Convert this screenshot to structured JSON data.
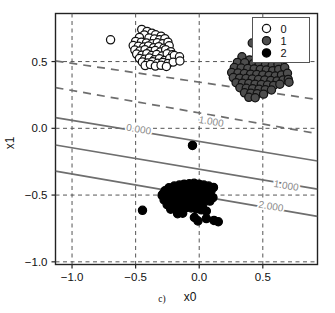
{
  "figure": {
    "panel_label": "c)",
    "background_color": "#ffffff"
  },
  "chart_data": {
    "type": "scatter",
    "title": "",
    "xlabel": "x0",
    "ylabel": "x1",
    "xlim": [
      -1.13,
      0.93
    ],
    "ylim": [
      -1.02,
      0.86
    ],
    "xticks": [
      -1.0,
      -0.5,
      0.0,
      0.5
    ],
    "yticks": [
      -1.0,
      -0.5,
      0.0,
      0.5
    ],
    "xticklabels": [
      "-1.0",
      "-0.5",
      "0.0",
      "0.5"
    ],
    "yticklabels": [
      "-1.0",
      "-0.5",
      "0.0",
      "0.5"
    ],
    "grid": true,
    "grid_style": "dashed",
    "grid_color": "#555555",
    "legend_position": "upper right",
    "series": [
      {
        "name": "0",
        "label": "0",
        "marker": "circle",
        "marker_fill": "#ffffff",
        "marker_edge": "#111111",
        "points": [
          [
            -0.697,
            0.663
          ],
          [
            -0.452,
            0.741
          ],
          [
            -0.41,
            0.726
          ],
          [
            -0.372,
            0.713
          ],
          [
            -0.432,
            0.7
          ],
          [
            -0.343,
            0.701
          ],
          [
            -0.3,
            0.69
          ],
          [
            -0.47,
            0.681
          ],
          [
            -0.395,
            0.676
          ],
          [
            -0.352,
            0.669
          ],
          [
            -0.312,
            0.663
          ],
          [
            -0.27,
            0.672
          ],
          [
            -0.5,
            0.651
          ],
          [
            -0.455,
            0.645
          ],
          [
            -0.415,
            0.64
          ],
          [
            -0.37,
            0.634
          ],
          [
            -0.33,
            0.641
          ],
          [
            -0.288,
            0.633
          ],
          [
            -0.246,
            0.645
          ],
          [
            -0.519,
            0.62
          ],
          [
            -0.478,
            0.614
          ],
          [
            -0.437,
            0.609
          ],
          [
            -0.399,
            0.617
          ],
          [
            -0.358,
            0.604
          ],
          [
            -0.318,
            0.612
          ],
          [
            -0.277,
            0.6
          ],
          [
            -0.236,
            0.618
          ],
          [
            -0.506,
            0.586
          ],
          [
            -0.466,
            0.58
          ],
          [
            -0.426,
            0.589
          ],
          [
            -0.387,
            0.576
          ],
          [
            -0.346,
            0.583
          ],
          [
            -0.305,
            0.572
          ],
          [
            -0.264,
            0.589
          ],
          [
            -0.224,
            0.574
          ],
          [
            -0.492,
            0.556
          ],
          [
            -0.451,
            0.548
          ],
          [
            -0.412,
            0.559
          ],
          [
            -0.374,
            0.545
          ],
          [
            -0.334,
            0.553
          ],
          [
            -0.292,
            0.541
          ],
          [
            -0.252,
            0.558
          ],
          [
            -0.21,
            0.551
          ],
          [
            -0.47,
            0.524
          ],
          [
            -0.43,
            0.517
          ],
          [
            -0.392,
            0.527
          ],
          [
            -0.353,
            0.513
          ],
          [
            -0.313,
            0.521
          ],
          [
            -0.272,
            0.509
          ],
          [
            -0.232,
            0.523
          ],
          [
            -0.196,
            0.545
          ],
          [
            -0.447,
            0.497
          ],
          [
            -0.406,
            0.489
          ],
          [
            -0.367,
            0.498
          ],
          [
            -0.328,
            0.487
          ],
          [
            -0.287,
            0.494
          ],
          [
            -0.245,
            0.486
          ],
          [
            -0.205,
            0.496
          ],
          [
            -0.425,
            0.47
          ],
          [
            -0.384,
            0.478
          ],
          [
            -0.345,
            0.466
          ],
          [
            -0.3,
            0.472
          ],
          [
            -0.258,
            0.463
          ],
          [
            -0.155,
            0.536
          ],
          [
            -0.152,
            0.504
          ]
        ]
      },
      {
        "name": "1",
        "label": "1",
        "marker": "circle",
        "marker_fill": "#4d4d4d",
        "marker_edge": "#111111",
        "points": [
          [
            0.417,
            0.639
          ],
          [
            0.478,
            0.625
          ],
          [
            0.531,
            0.598
          ],
          [
            0.566,
            0.57
          ],
          [
            0.515,
            0.554
          ],
          [
            0.336,
            0.536
          ],
          [
            0.452,
            0.536
          ],
          [
            0.56,
            0.52
          ],
          [
            0.396,
            0.512
          ],
          [
            0.489,
            0.505
          ],
          [
            0.3,
            0.494
          ],
          [
            0.358,
            0.491
          ],
          [
            0.425,
            0.484
          ],
          [
            0.471,
            0.48
          ],
          [
            0.521,
            0.474
          ],
          [
            0.573,
            0.468
          ],
          [
            0.619,
            0.48
          ],
          [
            0.276,
            0.455
          ],
          [
            0.33,
            0.452
          ],
          [
            0.382,
            0.448
          ],
          [
            0.432,
            0.444
          ],
          [
            0.48,
            0.44
          ],
          [
            0.528,
            0.437
          ],
          [
            0.578,
            0.432
          ],
          [
            0.625,
            0.441
          ],
          [
            0.672,
            0.455
          ],
          [
            0.255,
            0.418
          ],
          [
            0.305,
            0.414
          ],
          [
            0.355,
            0.41
          ],
          [
            0.404,
            0.406
          ],
          [
            0.452,
            0.403
          ],
          [
            0.5,
            0.399
          ],
          [
            0.549,
            0.396
          ],
          [
            0.598,
            0.392
          ],
          [
            0.647,
            0.4
          ],
          [
            0.694,
            0.412
          ],
          [
            0.268,
            0.38
          ],
          [
            0.318,
            0.376
          ],
          [
            0.368,
            0.373
          ],
          [
            0.417,
            0.369
          ],
          [
            0.466,
            0.365
          ],
          [
            0.515,
            0.362
          ],
          [
            0.563,
            0.358
          ],
          [
            0.612,
            0.355
          ],
          [
            0.66,
            0.363
          ],
          [
            0.29,
            0.342
          ],
          [
            0.34,
            0.338
          ],
          [
            0.39,
            0.335
          ],
          [
            0.439,
            0.331
          ],
          [
            0.488,
            0.328
          ],
          [
            0.537,
            0.324
          ],
          [
            0.585,
            0.321
          ],
          [
            0.634,
            0.33
          ],
          [
            0.32,
            0.304
          ],
          [
            0.37,
            0.3
          ],
          [
            0.42,
            0.297
          ],
          [
            0.47,
            0.293
          ],
          [
            0.519,
            0.29
          ],
          [
            0.568,
            0.287
          ],
          [
            0.356,
            0.266
          ],
          [
            0.406,
            0.263
          ],
          [
            0.456,
            0.259
          ],
          [
            0.506,
            0.256
          ],
          [
            0.39,
            0.232
          ],
          [
            0.44,
            0.229
          ],
          [
            0.7,
            0.366
          ],
          [
            0.706,
            0.345
          ]
        ]
      },
      {
        "name": "2",
        "label": "2",
        "marker": "circle",
        "marker_fill": "#000000",
        "marker_edge": "#000000",
        "points": [
          [
            -0.053,
            -0.128
          ],
          [
            -0.446,
            -0.614
          ],
          [
            -0.286,
            -0.492
          ],
          [
            -0.238,
            -0.445
          ],
          [
            -0.196,
            -0.432
          ],
          [
            -0.156,
            -0.425
          ],
          [
            -0.118,
            -0.418
          ],
          [
            -0.078,
            -0.415
          ],
          [
            -0.04,
            -0.412
          ],
          [
            -0.002,
            -0.418
          ],
          [
            0.036,
            -0.425
          ],
          [
            0.074,
            -0.432
          ],
          [
            0.112,
            -0.443
          ],
          [
            -0.268,
            -0.467
          ],
          [
            -0.228,
            -0.461
          ],
          [
            -0.188,
            -0.456
          ],
          [
            -0.148,
            -0.452
          ],
          [
            -0.108,
            -0.448
          ],
          [
            -0.068,
            -0.446
          ],
          [
            -0.028,
            -0.449
          ],
          [
            0.012,
            -0.455
          ],
          [
            0.052,
            -0.463
          ],
          [
            0.092,
            -0.472
          ],
          [
            -0.292,
            -0.502
          ],
          [
            -0.252,
            -0.496
          ],
          [
            -0.212,
            -0.491
          ],
          [
            -0.172,
            -0.487
          ],
          [
            -0.132,
            -0.484
          ],
          [
            -0.092,
            -0.482
          ],
          [
            -0.052,
            -0.485
          ],
          [
            -0.012,
            -0.491
          ],
          [
            0.028,
            -0.499
          ],
          [
            0.068,
            -0.508
          ],
          [
            0.108,
            -0.519
          ],
          [
            -0.276,
            -0.537
          ],
          [
            -0.236,
            -0.532
          ],
          [
            -0.196,
            -0.527
          ],
          [
            -0.156,
            -0.523
          ],
          [
            -0.116,
            -0.52
          ],
          [
            -0.076,
            -0.518
          ],
          [
            -0.036,
            -0.521
          ],
          [
            0.004,
            -0.527
          ],
          [
            0.044,
            -0.535
          ],
          [
            0.084,
            -0.545
          ],
          [
            -0.252,
            -0.572
          ],
          [
            -0.212,
            -0.567
          ],
          [
            -0.172,
            -0.563
          ],
          [
            -0.132,
            -0.559
          ],
          [
            -0.092,
            -0.556
          ],
          [
            -0.052,
            -0.559
          ],
          [
            -0.012,
            -0.565
          ],
          [
            0.028,
            -0.573
          ],
          [
            -0.224,
            -0.606
          ],
          [
            -0.184,
            -0.601
          ],
          [
            -0.144,
            -0.597
          ],
          [
            -0.104,
            -0.594
          ],
          [
            -0.064,
            -0.597
          ],
          [
            -0.024,
            -0.603
          ],
          [
            0.016,
            -0.611
          ],
          [
            0.056,
            -0.62
          ],
          [
            -0.17,
            -0.64
          ],
          [
            -0.13,
            -0.636
          ],
          [
            -0.038,
            -0.668
          ],
          [
            0.056,
            -0.676
          ],
          [
            0.116,
            -0.69
          ],
          [
            0.15,
            -0.7
          ],
          [
            -0.01,
            -0.694
          ]
        ]
      }
    ],
    "contours": [
      {
        "label": "2.000",
        "style": "dashed",
        "color": "#6e6e6e",
        "x_start": -1.13,
        "y_start": 0.505,
        "x_end": 0.93,
        "y_end": 0.215,
        "label_x": 0.415,
        "label_y": 0.275
      },
      {
        "label": "1.000",
        "style": "dashed",
        "color": "#6e6e6e",
        "x_start": -1.13,
        "y_start": 0.305,
        "x_end": 0.93,
        "y_end": -0.04,
        "label_x": 0.09,
        "label_y": 0.05
      },
      {
        "label": "0.000",
        "style": "solid",
        "color": "#6e6e6e",
        "x_start": -1.13,
        "y_start": 0.08,
        "x_end": 0.93,
        "y_end": -0.245,
        "label_x": -0.48,
        "label_y": -0.008
      },
      {
        "label": "1.000",
        "style": "solid",
        "color": "#6e6e6e",
        "x_start": -1.13,
        "y_start": -0.125,
        "x_end": 0.93,
        "y_end": -0.455,
        "label_x": 0.68,
        "label_y": -0.43
      },
      {
        "label": "2.000",
        "style": "solid",
        "color": "#6e6e6e",
        "x_start": -1.13,
        "y_start": -0.32,
        "x_end": 0.93,
        "y_end": -0.66,
        "label_x": 0.56,
        "label_y": -0.585
      }
    ],
    "legend": {
      "entries": [
        {
          "label": "0",
          "fill": "#ffffff",
          "edge": "#111111"
        },
        {
          "label": "1",
          "fill": "#4d4d4d",
          "edge": "#111111"
        },
        {
          "label": "2",
          "fill": "#000000",
          "edge": "#000000"
        }
      ]
    }
  }
}
